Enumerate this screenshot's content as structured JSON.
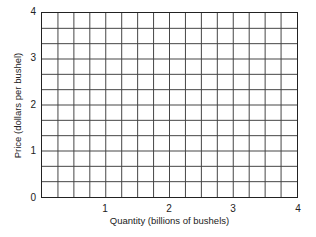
{
  "chart_data": {
    "type": "line",
    "title": "",
    "xlabel": "Quantity (billions of bushels)",
    "ylabel": "Price (dollars per bushel)",
    "xlim": [
      0,
      4
    ],
    "ylim": [
      0,
      4
    ],
    "x_ticks": [
      "1",
      "2",
      "3",
      "4"
    ],
    "y_ticks": [
      "0",
      "1",
      "2",
      "3",
      "4"
    ],
    "grid": true,
    "grid_divisions": {
      "x": 16,
      "y": 12
    },
    "series": []
  },
  "axes": {
    "y_origin_label": "0"
  }
}
